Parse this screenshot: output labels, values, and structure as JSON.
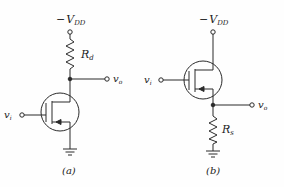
{
  "figure": {
    "type": "circuit-diagram",
    "colors": {
      "ink": "#2a2a2a",
      "background": "#fefefe"
    },
    "circuits": [
      {
        "id": "a",
        "caption": "(a)",
        "supply": {
          "sign": "−",
          "symbol": "V",
          "subscript": "DD"
        },
        "resistor": {
          "symbol": "R",
          "subscript": "d",
          "position": "drain"
        },
        "input": {
          "symbol": "v",
          "subscript": "i"
        },
        "output": {
          "symbol": "v",
          "subscript": "o",
          "node": "drain"
        },
        "transistor": "p-channel MOSFET",
        "ground": "source",
        "configuration": "common-source"
      },
      {
        "id": "b",
        "caption": "(b)",
        "supply": {
          "sign": "−",
          "symbol": "V",
          "subscript": "DD"
        },
        "resistor": {
          "symbol": "R",
          "subscript": "s",
          "position": "source"
        },
        "input": {
          "symbol": "v",
          "subscript": "i"
        },
        "output": {
          "symbol": "v",
          "subscript": "o",
          "node": "source"
        },
        "transistor": "p-channel MOSFET",
        "ground": "via Rs",
        "configuration": "source-follower"
      }
    ]
  }
}
